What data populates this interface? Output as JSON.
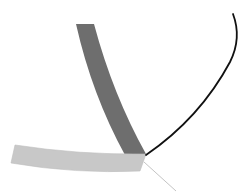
{
  "diagram": {
    "background": "#ffffff",
    "shapes": [
      {
        "id": "dark-band",
        "type": "curved-band",
        "fill": "#6e6e6e",
        "path": "M76,24 L94,24 Q113,95 146,154 L125,155 Q92,95 76,24 Z"
      },
      {
        "id": "light-band",
        "type": "curved-band",
        "fill": "#c8c8c8",
        "stroke": "#bdbdbd",
        "path": "M15,145 Q80,155 146,154 L140,171 Q75,174 11,163 Z"
      },
      {
        "id": "black-arc",
        "type": "curve",
        "stroke": "#111111",
        "stroke_width": 1.8,
        "path": "M233,14 Q242,38 230,62 Q200,118 146,155"
      },
      {
        "id": "thin-gray-line",
        "type": "line",
        "stroke": "#c4c4c4",
        "stroke_width": 1,
        "x1": 144,
        "y1": 162,
        "x2": 176,
        "y2": 191
      }
    ]
  }
}
